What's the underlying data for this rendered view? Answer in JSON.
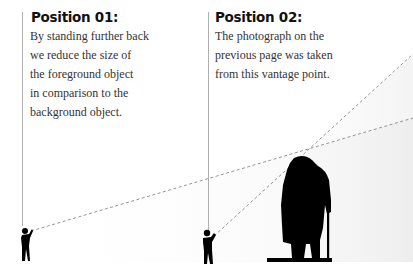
{
  "positions": [
    {
      "title": "Position 01:",
      "lines": [
        "By standing further back",
        "we reduce the size of",
        "the foreground object",
        "in comparison to the",
        "background object."
      ]
    },
    {
      "title": "Position 02:",
      "lines": [
        "The photograph on the",
        "previous page was taken",
        "from this vantage point."
      ]
    }
  ],
  "colors": {
    "text_heading": "#111111",
    "text_body": "#333333",
    "silhouette": "#000000",
    "sightline": "#888888",
    "leader_line": "#999999",
    "shading": "#f3f3f3"
  }
}
